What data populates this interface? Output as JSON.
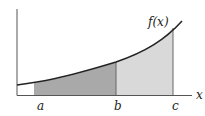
{
  "diagram": {
    "function_label": "f(x)",
    "x_axis_label": "x",
    "points": [
      {
        "label": "a"
      },
      {
        "label": "b"
      },
      {
        "label": "c"
      }
    ],
    "regions": [
      {
        "name": "integral-a-to-b",
        "color": "#a9a9a9"
      },
      {
        "name": "integral-b-to-c",
        "color": "#d9d9d9"
      }
    ],
    "curve_color": "#222222",
    "axis_color": "#555555"
  }
}
